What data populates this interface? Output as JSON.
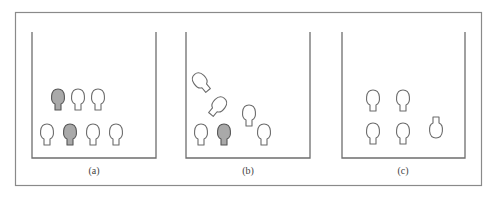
{
  "figure": {
    "colors": {
      "filled": "#a9a9a9",
      "filled_stroke": "#555555",
      "empty": "#ffffff",
      "empty_stroke": "#6a6a6a"
    },
    "panels": [
      {
        "id": "a",
        "label": "(a)",
        "objects": [
          {
            "kind": "bulb",
            "filled": true,
            "orientation": "upright"
          },
          {
            "kind": "bulb",
            "filled": false,
            "orientation": "upright"
          },
          {
            "kind": "bulb",
            "filled": false,
            "orientation": "upright"
          },
          {
            "kind": "bulb",
            "filled": false,
            "orientation": "upright"
          },
          {
            "kind": "bulb",
            "filled": true,
            "orientation": "upright"
          },
          {
            "kind": "bulb",
            "filled": false,
            "orientation": "upright"
          },
          {
            "kind": "bulb",
            "filled": false,
            "orientation": "upright"
          }
        ]
      },
      {
        "id": "b",
        "label": "(b)",
        "objects": [
          {
            "kind": "bulb",
            "filled": false,
            "orientation": "tilted-left"
          },
          {
            "kind": "bulb",
            "filled": false,
            "orientation": "tilted-right"
          },
          {
            "kind": "bulb",
            "filled": false,
            "orientation": "upright"
          },
          {
            "kind": "bulb",
            "filled": false,
            "orientation": "upright"
          },
          {
            "kind": "bulb",
            "filled": true,
            "orientation": "upright"
          },
          {
            "kind": "bulb",
            "filled": false,
            "orientation": "upright"
          }
        ]
      },
      {
        "id": "c",
        "label": "(c)",
        "objects": [
          {
            "kind": "bulb",
            "filled": false,
            "orientation": "upright"
          },
          {
            "kind": "bulb",
            "filled": false,
            "orientation": "upright"
          },
          {
            "kind": "bulb",
            "filled": false,
            "orientation": "upright"
          },
          {
            "kind": "bulb",
            "filled": false,
            "orientation": "upright"
          },
          {
            "kind": "bulb",
            "filled": false,
            "orientation": "inverted"
          }
        ]
      }
    ]
  }
}
